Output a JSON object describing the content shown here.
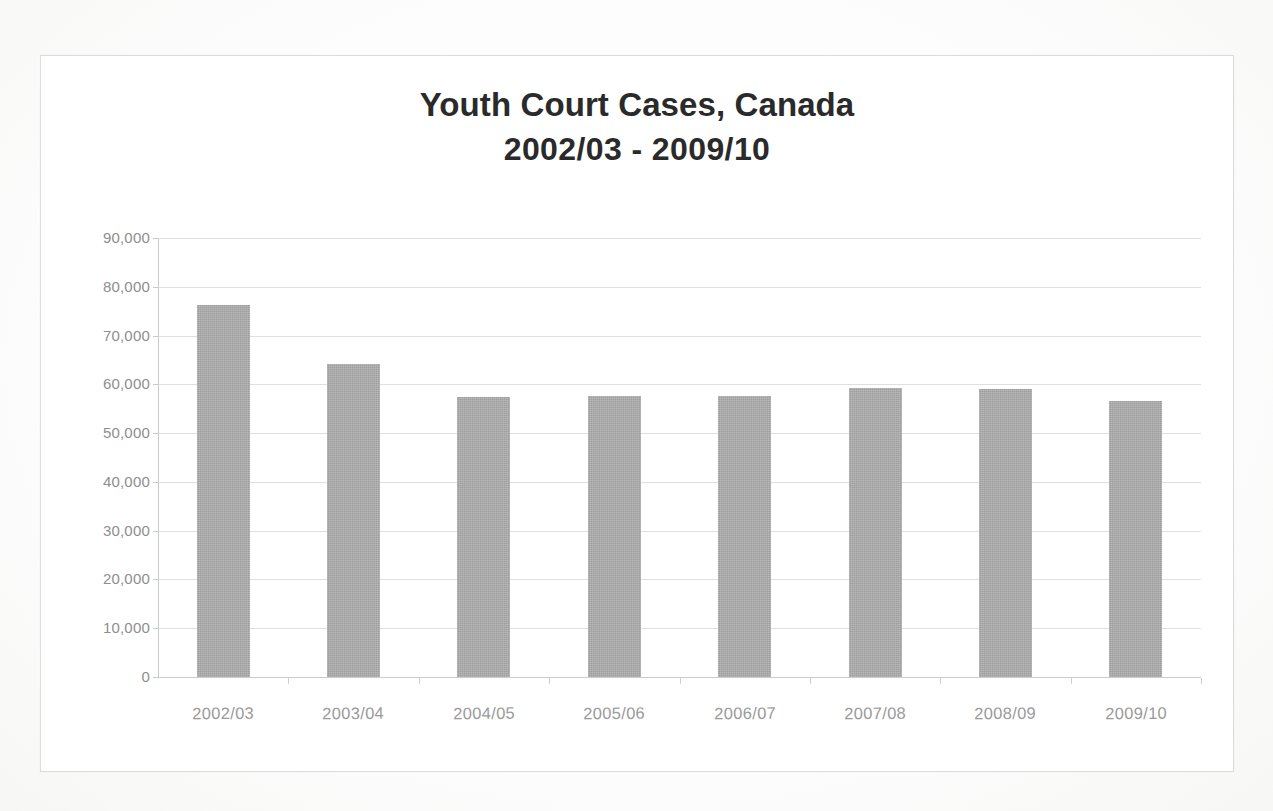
{
  "document": {
    "type": "scanned-bar-chart",
    "background_color": "#ffffff",
    "frame_color": "#dcdcdc"
  },
  "chart_data": {
    "type": "bar",
    "title": "Youth Court Cases, Canada\n2002/03 - 2009/10",
    "title_line1": "Youth Court Cases, Canada",
    "title_line2": "2002/03 - 2009/10",
    "xlabel": "",
    "ylabel": "",
    "categories": [
      "2002/03",
      "2003/04",
      "2004/05",
      "2005/06",
      "2006/07",
      "2007/08",
      "2008/09",
      "2009/10"
    ],
    "values": [
      76200,
      64200,
      57400,
      57600,
      57600,
      59300,
      59000,
      56600
    ],
    "series": [
      {
        "name": "Youth court cases",
        "values": [
          76200,
          64200,
          57400,
          57600,
          57600,
          59300,
          59000,
          56600
        ],
        "color": "#a9a9a9"
      }
    ],
    "ylim": [
      0,
      90000
    ],
    "ytick_values": [
      90000,
      80000,
      70000,
      60000,
      50000,
      40000,
      30000,
      20000,
      10000,
      0
    ],
    "ytick_labels": [
      "90,000",
      "80,000",
      "70,000",
      "60,000",
      "50,000",
      "40,000",
      "30,000",
      "20,000",
      "10,000",
      "0"
    ],
    "grid": true,
    "grid_axis": "y",
    "grid_color": "#d9d9d9",
    "legend": false,
    "legend_position": "none",
    "bar_color": "#a9a9a9",
    "tick_label_color": "#8e8e8e",
    "title_color": "#2a2a2a"
  }
}
